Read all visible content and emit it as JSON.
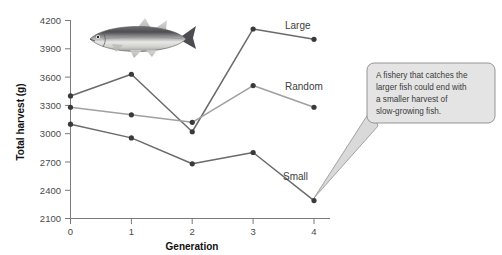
{
  "chart_data": {
    "type": "line",
    "title": "",
    "xlabel": "Generation",
    "ylabel": "Total harvest (g)",
    "categories": [
      "0",
      "1",
      "2",
      "3",
      "4"
    ],
    "x": [
      0,
      1,
      2,
      3,
      4
    ],
    "xlim": [
      0,
      4
    ],
    "ylim": [
      2100,
      4200
    ],
    "ytick_labels": [
      "4200",
      "3900",
      "3600",
      "3300",
      "3000",
      "2700",
      "2400",
      "2100"
    ],
    "yticks": [
      4200,
      3900,
      3600,
      3300,
      3000,
      2700,
      2400,
      2100
    ],
    "xtick_labels": [
      "0",
      "1",
      "2",
      "3",
      "4"
    ],
    "grid": false,
    "legend_position": "inline-right-of-series",
    "series": [
      {
        "name": "Large",
        "label": "Large",
        "color": "#6b6b6b",
        "values": [
          3400,
          3630,
          3020,
          4110,
          4000
        ]
      },
      {
        "name": "Random",
        "label": "Random",
        "color": "#a0a0a0",
        "values": [
          3280,
          3200,
          3120,
          3510,
          3280
        ]
      },
      {
        "name": "Small",
        "label": "Small",
        "color": "#6b6b6b",
        "values": [
          3100,
          2955,
          2680,
          2800,
          2290
        ]
      }
    ]
  },
  "axes": {
    "y_title": "Total harvest (g)",
    "x_title": "Generation"
  },
  "series_labels": {
    "large": "Large",
    "random": "Random",
    "small": "Small"
  },
  "callout": {
    "lines": [
      "A fishery that catches the",
      "larger fish could end with",
      "a smaller harvest of",
      "slow-growing fish."
    ],
    "line_1": "A fishery that catches the",
    "line_2": "larger fish could end with",
    "line_3": "a smaller harvest of",
    "line_4": "slow-growing fish.",
    "background": "#e4e4e4",
    "border": "#8a8a8a"
  },
  "illustration": {
    "name": "fish-illustration",
    "description": "Silver fish illustration"
  },
  "colors": {
    "axis": "#7a7a7a",
    "dark_series": "#6b6b6b",
    "light_series": "#a0a0a0",
    "marker": "#3a3a3a",
    "text": "#3d3d3d"
  }
}
